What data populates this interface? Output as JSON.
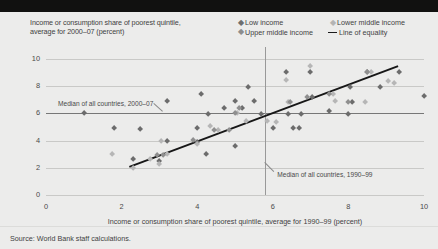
{
  "figure": {
    "title_line1": "Income or consumption share of poorest quintile,",
    "title_line2": "average for 2000–07 (percent)",
    "source": "Source: World Bank staff calculations."
  },
  "legend": {
    "items": [
      {
        "label": "Low income",
        "marker": "diamond-icon",
        "color": "#6c6c6c"
      },
      {
        "label": "Lower middle income",
        "marker": "diamond-icon",
        "color": "#b6b6b6"
      },
      {
        "label": "Upper middle income",
        "marker": "diamond-icon",
        "color": "#8f8f8f"
      },
      {
        "label": "Line of equality",
        "marker": "line-icon",
        "color": "#171717"
      }
    ]
  },
  "chart_data": {
    "type": "scatter",
    "title": "Income or consumption share of poorest quintile, average for 2000–07 (percent)",
    "xlabel": "Income or consumption share of poorest quintile, average for 1990–99 (percent)",
    "ylabel": "Income or consumption share of poorest quintile, average for 2000–07 (percent)",
    "xlim": [
      0,
      10
    ],
    "ylim": [
      0,
      10
    ],
    "xticks": [
      0,
      2,
      4,
      6,
      8,
      10
    ],
    "yticks": [
      0,
      2,
      4,
      6,
      8,
      10
    ],
    "grid": true,
    "legend_position": "top-right",
    "annotations": [
      {
        "text": "Median of all countries, 2000–07",
        "type": "horizontal-median",
        "value": 6.0
      },
      {
        "text": "Median of all countries, 1990–99",
        "type": "vertical-median",
        "value": 5.8
      }
    ],
    "reference_line": {
      "name": "Line of equality",
      "x": [
        2.2,
        9.3
      ],
      "y": [
        2.15,
        9.55
      ]
    },
    "series": [
      {
        "name": "Low income",
        "color": "#6c6c6c",
        "points": [
          [
            1.0,
            6.0
          ],
          [
            1.8,
            4.9
          ],
          [
            2.3,
            2.65
          ],
          [
            2.5,
            4.85
          ],
          [
            3.0,
            2.5
          ],
          [
            3.2,
            3.95
          ],
          [
            3.2,
            6.9
          ],
          [
            4.0,
            3.85
          ],
          [
            4.0,
            4.95
          ],
          [
            4.1,
            7.4
          ],
          [
            4.25,
            3.0
          ],
          [
            4.3,
            5.95
          ],
          [
            4.7,
            6.4
          ],
          [
            5.0,
            3.6
          ],
          [
            5.0,
            6.9
          ],
          [
            5.2,
            6.4
          ],
          [
            5.35,
            7.95
          ],
          [
            5.5,
            6.9
          ],
          [
            5.7,
            5.95
          ],
          [
            6.0,
            4.9
          ],
          [
            6.35,
            9.0
          ],
          [
            6.4,
            5.95
          ],
          [
            6.55,
            4.95
          ],
          [
            6.7,
            4.95
          ],
          [
            6.75,
            5.95
          ],
          [
            7.0,
            9.0
          ],
          [
            7.05,
            7.2
          ],
          [
            7.5,
            6.2
          ],
          [
            8.0,
            5.95
          ],
          [
            8.05,
            7.95
          ],
          [
            8.1,
            6.85
          ],
          [
            8.5,
            9.05
          ],
          [
            8.85,
            7.95
          ],
          [
            9.35,
            9.0
          ],
          [
            10.0,
            7.3
          ]
        ]
      },
      {
        "name": "Lower middle income",
        "color": "#b6b6b6",
        "points": [
          [
            1.75,
            3.0
          ],
          [
            2.3,
            2.0
          ],
          [
            2.75,
            2.65
          ],
          [
            3.0,
            2.3
          ],
          [
            3.05,
            3.95
          ],
          [
            3.2,
            3.0
          ],
          [
            4.0,
            3.75
          ],
          [
            4.35,
            5.05
          ],
          [
            4.55,
            4.75
          ],
          [
            5.05,
            6.05
          ],
          [
            5.3,
            5.45
          ],
          [
            5.85,
            5.4
          ],
          [
            6.1,
            5.35
          ],
          [
            6.35,
            8.45
          ],
          [
            6.4,
            6.85
          ],
          [
            7.0,
            9.5
          ],
          [
            7.6,
            7.4
          ],
          [
            7.65,
            6.9
          ],
          [
            8.45,
            6.85
          ],
          [
            8.6,
            9.05
          ],
          [
            9.05,
            8.4
          ],
          [
            9.2,
            8.25
          ]
        ]
      },
      {
        "name": "Upper middle income",
        "color": "#8f8f8f",
        "points": [
          [
            2.95,
            2.95
          ],
          [
            3.1,
            2.95
          ],
          [
            3.9,
            4.05
          ],
          [
            4.45,
            4.8
          ],
          [
            4.85,
            4.75
          ],
          [
            5.0,
            6.0
          ],
          [
            5.1,
            6.4
          ],
          [
            6.45,
            6.85
          ],
          [
            6.9,
            7.2
          ],
          [
            7.5,
            7.45
          ],
          [
            8.0,
            6.85
          ],
          [
            8.5,
            9.0
          ]
        ]
      }
    ]
  }
}
